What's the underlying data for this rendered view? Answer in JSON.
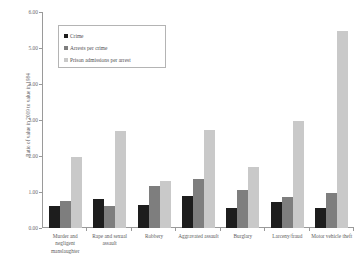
{
  "chart_data": {
    "type": "bar",
    "title": "",
    "xlabel": "",
    "ylabel": "Ratio of value in 2009 to value in 1984",
    "ylim": [
      0.0,
      6.0
    ],
    "ytick_labels": [
      "6.00",
      "5.00",
      "4.00",
      "3.00",
      "2.00",
      "1.00",
      "0.00"
    ],
    "ytick_values": [
      6.0,
      5.0,
      4.0,
      3.0,
      2.0,
      1.0,
      0.0
    ],
    "grid": false,
    "legend_position": "upper-left-inside",
    "categories": [
      "Murder and negligent manslaughter",
      "Rape and sexual assault",
      "Robbery",
      "Aggravated assault",
      "Burglary",
      "Larceny/fraud",
      "Motor vehicle theft"
    ],
    "series": [
      {
        "name": "Crime",
        "color": "#1d1d1d",
        "values": [
          0.62,
          0.8,
          0.63,
          0.89,
          0.55,
          0.72,
          0.56
        ]
      },
      {
        "name": "Arrests per crime",
        "color": "#7e7e7e",
        "values": [
          0.76,
          0.62,
          1.17,
          1.37,
          1.05,
          0.85,
          0.98
        ]
      },
      {
        "name": "Prison admissions per arrest",
        "color": "#c9c9c9",
        "values": [
          1.96,
          2.69,
          1.3,
          2.72,
          1.7,
          2.98,
          5.47
        ]
      }
    ]
  },
  "axis": {
    "y_title": "Ratio of value in 2009 to value in 1984"
  },
  "legend": {
    "items": [
      {
        "label": "Crime"
      },
      {
        "label": "Arrests per crime"
      },
      {
        "label": "Prison admissions per arrest"
      }
    ]
  },
  "x_labels": [
    "Murder and negligent manslaughter",
    "Rape and sexual assault",
    "Robbery",
    "Aggravated assault",
    "Burglary",
    "Larceny/fraud",
    "Motor vehicle theft"
  ],
  "y_ticks": [
    "6.00",
    "5.00",
    "4.00",
    "3.00",
    "2.00",
    "1.00",
    "0.00"
  ]
}
